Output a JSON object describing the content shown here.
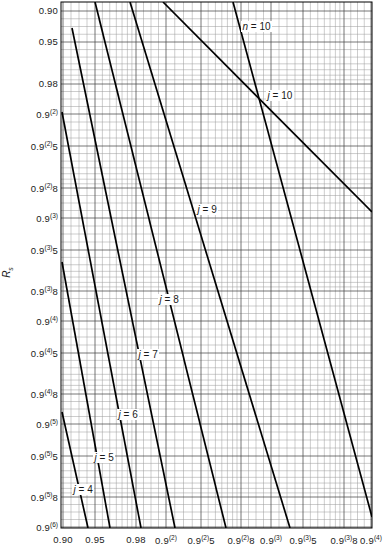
{
  "chart_data": {
    "type": "line",
    "title": "",
    "xlabel": "",
    "ylabel": "R_s",
    "scale": "normal-probability (reliability) grid, both axes",
    "grid": true,
    "legend_position": "inline-labels",
    "x_axis": {
      "tick_labels": [
        "0.90",
        "0.95",
        "0.98",
        "0.9(2)",
        "0.9(2)5",
        "0.9(2)8",
        "0.9(3)",
        "0.9(3)5",
        "0.9(3)8",
        "0.9(4)"
      ],
      "tick_values": [
        0.9,
        0.95,
        0.98,
        0.99,
        0.995,
        0.998,
        0.999,
        0.9995,
        0.9998,
        0.9999
      ],
      "range": [
        0.9,
        0.9999
      ]
    },
    "y_axis": {
      "tick_labels": [
        "0.90",
        "0.95",
        "0.98",
        "0.9(2)",
        "0.9(2)5",
        "0.9(2)8",
        "0.9(3)",
        "0.9(3)5",
        "0.9(3)8",
        "0.9(4)",
        "0.9(4)5",
        "0.9(4)8",
        "0.9(5)",
        "0.9(5)5",
        "0.9(5)8",
        "0.9(6)"
      ],
      "tick_values": [
        0.9,
        0.95,
        0.98,
        0.99,
        0.995,
        0.998,
        0.999,
        0.9995,
        0.9998,
        0.9999,
        0.99995,
        0.99998,
        0.999999,
        0.9999995,
        0.9999998,
        0.9999999
      ],
      "range": [
        0.9,
        0.9999999
      ],
      "direction": "increasing-downward"
    },
    "annotations": [
      {
        "text": "n = 10",
        "x_px": 241,
        "y_px": 27
      },
      {
        "text": "j = 10",
        "x_px": 266,
        "y_px": 96
      },
      {
        "text": "j = 9",
        "x_px": 196,
        "y_px": 210
      },
      {
        "text": "j = 8",
        "x_px": 158,
        "y_px": 300
      },
      {
        "text": "j = 7",
        "x_px": 137,
        "y_px": 355
      },
      {
        "text": "j = 6",
        "x_px": 117,
        "y_px": 415
      },
      {
        "text": "j = 5",
        "x_px": 93,
        "y_px": 458
      },
      {
        "text": "j = 4",
        "x_px": 72,
        "y_px": 490
      }
    ],
    "series": [
      {
        "name": "n = 10",
        "label": "n = 10",
        "points_px": [
          [
            163,
            2
          ],
          [
            372,
            212
          ]
        ]
      },
      {
        "name": "j = 10",
        "label": "j = 10",
        "points_px": [
          [
            233,
            2
          ],
          [
            372,
            517
          ]
        ]
      },
      {
        "name": "j = 9",
        "label": "j = 9",
        "points_px": [
          [
            130,
            2
          ],
          [
            290,
            528
          ]
        ]
      },
      {
        "name": "j = 8",
        "label": "j = 8",
        "points_px": [
          [
            95,
            2
          ],
          [
            226,
            528
          ]
        ]
      },
      {
        "name": "j = 7",
        "label": "j = 7",
        "points_px": [
          [
            72,
            28
          ],
          [
            175,
            528
          ]
        ]
      },
      {
        "name": "j = 6",
        "label": "j = 6",
        "points_px": [
          [
            62,
            112
          ],
          [
            141,
            528
          ]
        ]
      },
      {
        "name": "j = 5",
        "label": "j = 5",
        "points_px": [
          [
            62,
            262
          ],
          [
            110,
            528
          ]
        ]
      },
      {
        "name": "j = 4",
        "label": "j = 4",
        "points_px": [
          [
            62,
            412
          ],
          [
            88,
            528
          ]
        ]
      }
    ]
  },
  "axes": {
    "y_title_main": "R",
    "y_title_sub": "s",
    "y_ticks": [
      {
        "base": "0.90",
        "sup": "",
        "tail": "",
        "y": 11
      },
      {
        "base": "0.95",
        "sup": "",
        "tail": "",
        "y": 42
      },
      {
        "base": "0.98",
        "sup": "",
        "tail": "",
        "y": 84
      },
      {
        "base": "0.9",
        "sup": "(2)",
        "tail": "",
        "y": 114
      },
      {
        "base": "0.9",
        "sup": "(2)",
        "tail": "5",
        "y": 146
      },
      {
        "base": "0.9",
        "sup": "(2)",
        "tail": "8",
        "y": 188
      },
      {
        "base": "0.9",
        "sup": "(3)",
        "tail": "",
        "y": 218
      },
      {
        "base": "0.9",
        "sup": "(3)",
        "tail": "5",
        "y": 250
      },
      {
        "base": "0.9",
        "sup": "(3)",
        "tail": "8",
        "y": 291
      },
      {
        "base": "0.9",
        "sup": "(4)",
        "tail": "",
        "y": 321
      },
      {
        "base": "0.9",
        "sup": "(4)",
        "tail": "5",
        "y": 353
      },
      {
        "base": "0.9",
        "sup": "(4)",
        "tail": "8",
        "y": 394
      },
      {
        "base": "0.9",
        "sup": "(5)",
        "tail": "",
        "y": 424
      },
      {
        "base": "0.9",
        "sup": "(5)",
        "tail": "5",
        "y": 456
      },
      {
        "base": "0.9",
        "sup": "(5)",
        "tail": "8",
        "y": 497
      },
      {
        "base": "0.9",
        "sup": "(6)",
        "tail": "",
        "y": 527
      }
    ],
    "x_ticks": [
      {
        "base": "0.90",
        "sup": "",
        "tail": "",
        "x": 63
      },
      {
        "base": "0.95",
        "sup": "",
        "tail": "",
        "x": 95
      },
      {
        "base": "0.98",
        "sup": "",
        "tail": "",
        "x": 136
      },
      {
        "base": "0.9",
        "sup": "(2)",
        "tail": "",
        "x": 166
      },
      {
        "base": "0.9",
        "sup": "(2)",
        "tail": "5",
        "x": 201
      },
      {
        "base": "0.9",
        "sup": "(2)",
        "tail": "8",
        "x": 241
      },
      {
        "base": "0.9",
        "sup": "(3)",
        "tail": "",
        "x": 271
      },
      {
        "base": "0.9",
        "sup": "(3)",
        "tail": "5",
        "x": 303
      },
      {
        "base": "0.9",
        "sup": "(3)",
        "tail": "8",
        "x": 344
      },
      {
        "base": "0.9",
        "sup": "(4)",
        "tail": "",
        "x": 371
      }
    ]
  },
  "plot_box": {
    "left": 61,
    "top": 2,
    "right": 372,
    "bottom": 528
  },
  "colors": {
    "curve": "#000000",
    "grid_major": "#4a4a4a",
    "grid_minor": "#9a9a9a",
    "frame": "#000000",
    "background": "#ffffff",
    "text": "#1a1a1a"
  }
}
